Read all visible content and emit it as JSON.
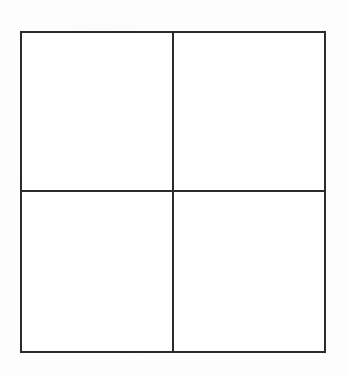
{
  "page": {
    "background_color": "#fdfdfd",
    "width": 347,
    "height": 375
  },
  "figure": {
    "name": "2x2-grid",
    "line_color": "#2b2b2b",
    "fill_color": "#ffffff",
    "border_width_px": 2,
    "divider_width_px": 2,
    "rows": 2,
    "columns": 2,
    "cell_count": 4,
    "caption": "",
    "title": ""
  },
  "cells": [
    {
      "id": "top-left",
      "row": 1,
      "column": 1,
      "label": ""
    },
    {
      "id": "top-right",
      "row": 1,
      "column": 2,
      "label": ""
    },
    {
      "id": "bottom-left",
      "row": 2,
      "column": 1,
      "label": ""
    },
    {
      "id": "bottom-right",
      "row": 2,
      "column": 2,
      "label": ""
    }
  ],
  "labels": {
    "row_headers": [],
    "column_headers": [],
    "annotations": []
  }
}
